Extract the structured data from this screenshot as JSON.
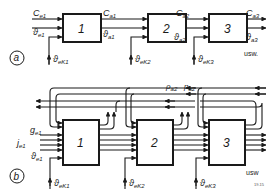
{
  "diagram": {
    "part_a": {
      "tag": "a",
      "blocks": [
        "1",
        "2",
        "3"
      ],
      "inputs": {
        "c": "C",
        "c_sub": "e1",
        "theta": "ϑ",
        "theta_sub": "e1"
      },
      "outputs": [
        {
          "c": "C",
          "c_sub": "a1",
          "theta": "ϑ",
          "theta_sub": "a1"
        },
        {
          "c": "C",
          "c_sub": "a2",
          "theta": "ϑ",
          "theta_sub": "a2"
        },
        {
          "c": "C",
          "c_sub": "a3",
          "theta": "ϑ",
          "theta_sub": "a3"
        }
      ],
      "coolant_inputs": [
        {
          "sym": "ϑ",
          "sub": "eK1"
        },
        {
          "sym": "ϑ",
          "sub": "eK2"
        },
        {
          "sym": "ϑ",
          "sub": "eK3"
        }
      ],
      "continuation": "usw."
    },
    "part_b": {
      "tag": "b",
      "blocks": [
        "1",
        "2",
        "3"
      ],
      "inputs": {
        "g": "g",
        "g_sub": "e1",
        "j": "j",
        "j_sub": "e1",
        "theta": "ϑ",
        "theta_sub": "e1"
      },
      "feedback_labels": {
        "rho": "ρ",
        "rho_sub": "a2",
        "p": "p",
        "p_sub": "a2"
      },
      "coolant_inputs": [
        {
          "sym": "ϑ",
          "sub": "eK1"
        },
        {
          "sym": "ϑ",
          "sub": "eK2"
        },
        {
          "sym": "ϑ",
          "sub": "eK3"
        }
      ],
      "continuation": "usw"
    },
    "figure_number": "19.15"
  }
}
